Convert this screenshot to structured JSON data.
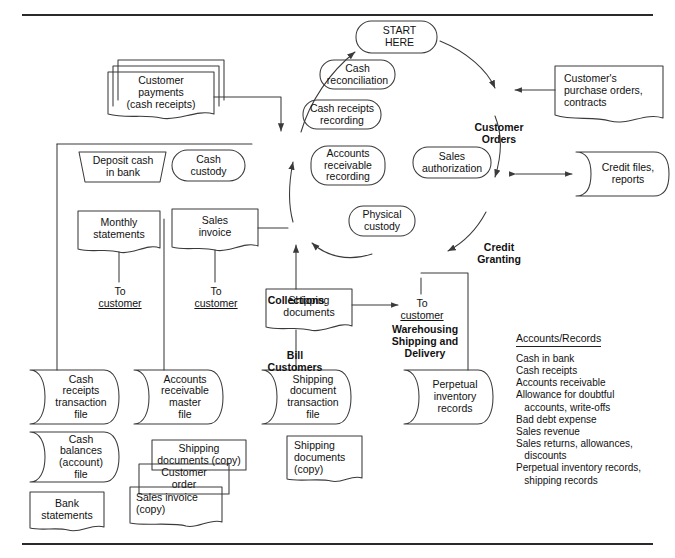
{
  "diagram": {
    "frame": {
      "top_rule": true,
      "bottom_rule": true
    }
  },
  "cycle_nodes": [
    {
      "id": "start-here",
      "label": "START\nHERE",
      "shape": "rounded"
    },
    {
      "id": "customer-orders",
      "label": "Customer\nOrders",
      "shape": "text-bold"
    },
    {
      "id": "credit-granting",
      "label": "Credit\nGranting",
      "shape": "text-bold"
    },
    {
      "id": "warehousing",
      "label": "Warehousing\nShipping and\nDelivery",
      "shape": "text-bold"
    },
    {
      "id": "bill-customers",
      "label": "Bill\nCustomers",
      "shape": "text-bold"
    },
    {
      "id": "collections",
      "label": "Collections",
      "shape": "text-bold"
    }
  ],
  "function_bubbles": [
    {
      "id": "cash-reconciliation",
      "label": "Cash\nreconciliation"
    },
    {
      "id": "cash-receipts-recording",
      "label": "Cash receipts\nrecording"
    },
    {
      "id": "accounts-receivable-recording",
      "label": "Accounts\nreceivable\nrecording"
    },
    {
      "id": "physical-custody",
      "label": "Physical\ncustody"
    },
    {
      "id": "sales-authorization",
      "label": "Sales\nauthorization"
    },
    {
      "id": "cash-custody",
      "label": "Cash\ncustody"
    }
  ],
  "documents": [
    {
      "id": "customer-payments",
      "label": "Customer\npayments\n(cash receipts)",
      "shape": "stacked-doc"
    },
    {
      "id": "customers-purchase-orders",
      "label": "Customer's\npurchase orders,\ncontracts",
      "shape": "doc"
    },
    {
      "id": "monthly-statements",
      "label": "Monthly\nstatements",
      "shape": "doc"
    },
    {
      "id": "sales-invoice",
      "label": "Sales\ninvoice",
      "shape": "doc"
    },
    {
      "id": "shipping-documents",
      "label": "Shipping\ndocuments",
      "shape": "doc"
    },
    {
      "id": "shipping-documents-copy-1",
      "label": "Shipping\ndocuments (copy)",
      "shape": "doc"
    },
    {
      "id": "customer-order-copy",
      "label": "Customer\norder",
      "shape": "doc"
    },
    {
      "id": "sales-invoice-copy",
      "label": "Sales invoice\n(copy)",
      "shape": "doc"
    },
    {
      "id": "shipping-documents-copy-2",
      "label": "Shipping\ndocuments\n(copy)",
      "shape": "doc"
    },
    {
      "id": "bank-statements",
      "label": "Bank\nstatements",
      "shape": "doc"
    }
  ],
  "manual_ops": [
    {
      "id": "deposit-cash-in-bank",
      "label": "Deposit cash\nin bank",
      "shape": "trapezoid"
    }
  ],
  "files": [
    {
      "id": "credit-files-reports",
      "label": "Credit files,\nreports",
      "shape": "storage"
    },
    {
      "id": "cash-receipts-transaction-file",
      "label": "Cash\nreceipts\ntransaction\nfile",
      "shape": "storage"
    },
    {
      "id": "cash-balances-account-file",
      "label": "Cash\nbalances\n(account)\nfile",
      "shape": "storage"
    },
    {
      "id": "accounts-receivable-master-file",
      "label": "Accounts\nreceivable\nmaster\nfile",
      "shape": "storage"
    },
    {
      "id": "shipping-document-transaction-file",
      "label": "Shipping\ndocument\ntransaction\nfile",
      "shape": "storage"
    },
    {
      "id": "perpetual-inventory-records",
      "label": "Perpetual\ninventory\nrecords",
      "shape": "storage"
    }
  ],
  "terminators": [
    {
      "id": "to-customer-statements",
      "label": "To",
      "sub": "customer"
    },
    {
      "id": "to-customer-invoice",
      "label": "To",
      "sub": "customer"
    },
    {
      "id": "to-customer-shipping",
      "label": "To",
      "sub": "customer"
    }
  ],
  "accounts_records": {
    "heading": "Accounts/Records",
    "items": [
      "Cash in bank",
      "Cash receipts",
      "Accounts receivable",
      "Allowance for doubtful\n   accounts, write-offs",
      "Bad debt expense",
      "Sales revenue",
      "Sales returns, allowances,\n   discounts",
      "Perpetual inventory records,\n   shipping records"
    ]
  },
  "colors": {
    "ink": "#111111",
    "stroke": "#3a3a3a",
    "background": "#ffffff",
    "rule": "#2a2a2a"
  }
}
